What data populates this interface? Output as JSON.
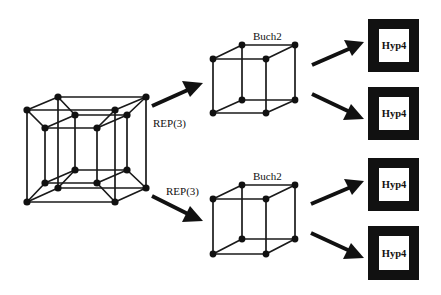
{
  "diagram": {
    "source_node": {
      "type": "hypercube-4d",
      "label": ""
    },
    "arrows_to_cubes": [
      {
        "label": "REP(3)"
      },
      {
        "label": "REP(3)"
      }
    ],
    "cubes": [
      {
        "label": "Buch2"
      },
      {
        "label": "Buch2"
      }
    ],
    "hyp_boxes": [
      {
        "label": "Hyp4"
      },
      {
        "label": "Hyp4"
      },
      {
        "label": "Hyp4"
      },
      {
        "label": "Hyp4"
      }
    ],
    "colors": {
      "ink": "#111111",
      "background": "#ffffff"
    }
  }
}
